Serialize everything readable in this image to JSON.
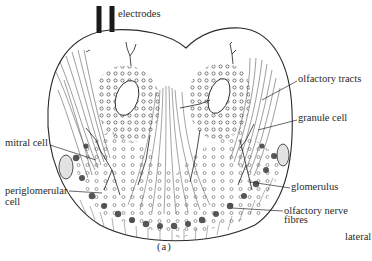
{
  "figure": {
    "caption": "(a)",
    "orientation_label": "lateral"
  },
  "labels": {
    "electrodes": "electrodes",
    "olfactory_tracts": "olfactory tracts",
    "granule_cell": "granule cell",
    "mitral_cell": "mitral cell",
    "periglomerular_line1": "periglomerular",
    "periglomerular_line2": "cell",
    "glomerulus": "glomerulus",
    "olfactory_nerve_line1": "olfactory nerve",
    "olfactory_nerve_line2": "fibres"
  },
  "colors": {
    "ink": "#2a2a2a",
    "background": "#ffffff",
    "shading": "#d8d8d8"
  }
}
